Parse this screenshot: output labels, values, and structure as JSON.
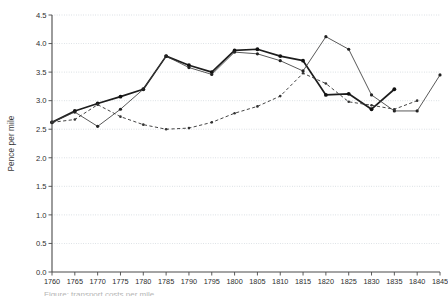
{
  "chart_data": {
    "type": "line",
    "title": "",
    "xlabel": "",
    "ylabel": "Pence per mile",
    "xlim": [
      1760,
      1845
    ],
    "ylim": [
      0.0,
      4.5
    ],
    "grid": true,
    "legend_position": "none",
    "x_ticks": [
      1760,
      1765,
      1770,
      1775,
      1780,
      1785,
      1790,
      1795,
      1800,
      1805,
      1810,
      1815,
      1820,
      1825,
      1830,
      1835,
      1840,
      1845
    ],
    "y_ticks": [
      "0.0",
      "0.5",
      "1.0",
      "1.5",
      "2.0",
      "2.5",
      "3.0",
      "3.5",
      "4.0",
      "4.5"
    ],
    "x": [
      1760,
      1765,
      1770,
      1775,
      1780,
      1785,
      1790,
      1795,
      1800,
      1805,
      1810,
      1815,
      1820,
      1825,
      1830,
      1835,
      1840,
      1845
    ],
    "series": [
      {
        "name": "series-thick-solid",
        "style": "solid-thick",
        "values": [
          2.62,
          2.82,
          2.95,
          3.07,
          3.2,
          3.78,
          3.62,
          3.5,
          3.88,
          3.9,
          3.78,
          3.7,
          3.1,
          3.12,
          2.85,
          3.2,
          null,
          null
        ]
      },
      {
        "name": "series-thin-solid",
        "style": "solid-thin",
        "values": [
          2.62,
          2.8,
          2.55,
          2.85,
          3.2,
          3.78,
          3.58,
          3.46,
          3.85,
          3.82,
          3.7,
          3.52,
          4.12,
          3.9,
          3.1,
          2.82,
          2.82,
          3.45
        ]
      },
      {
        "name": "series-dashed",
        "style": "dashed",
        "values": [
          2.62,
          2.67,
          2.93,
          2.72,
          2.58,
          2.5,
          2.52,
          2.62,
          2.78,
          2.9,
          3.08,
          3.48,
          3.3,
          2.98,
          2.92,
          2.85,
          3.0,
          null
        ]
      }
    ]
  },
  "axis": {
    "y_title": "Pence per mile"
  },
  "caption": {
    "text": "Figure: transport costs per mile"
  },
  "colors": {
    "axis": "#4a4a4a",
    "grid": "#b9c3cc",
    "series_primary": "#1d1d1d",
    "series_secondary": "#3b3b3b"
  }
}
